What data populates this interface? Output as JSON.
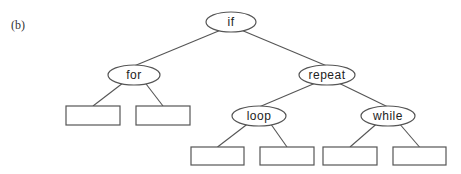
{
  "figure": {
    "panel_label": "(b)",
    "nodes": [
      {
        "id": "n_if",
        "label": "if",
        "shape": "ellipse",
        "parent": null
      },
      {
        "id": "n_for",
        "label": "for",
        "shape": "ellipse",
        "parent": "n_if"
      },
      {
        "id": "n_repeat",
        "label": "repeat",
        "shape": "ellipse",
        "parent": "n_if"
      },
      {
        "id": "n_for_l",
        "label": "",
        "shape": "rect",
        "parent": "n_for"
      },
      {
        "id": "n_for_r",
        "label": "",
        "shape": "rect",
        "parent": "n_for"
      },
      {
        "id": "n_loop",
        "label": "loop",
        "shape": "ellipse",
        "parent": "n_repeat"
      },
      {
        "id": "n_while",
        "label": "while",
        "shape": "ellipse",
        "parent": "n_repeat"
      },
      {
        "id": "n_loop_l",
        "label": "",
        "shape": "rect",
        "parent": "n_loop"
      },
      {
        "id": "n_loop_r",
        "label": "",
        "shape": "rect",
        "parent": "n_loop"
      },
      {
        "id": "n_while_l",
        "label": "",
        "shape": "rect",
        "parent": "n_while"
      },
      {
        "id": "n_while_r",
        "label": "",
        "shape": "rect",
        "parent": "n_while"
      }
    ]
  }
}
